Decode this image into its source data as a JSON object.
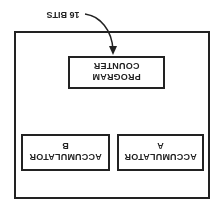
{
  "diagram": {
    "orientation": "rotated 180 degrees",
    "outer_box": {
      "label": ""
    },
    "program_counter": {
      "line1": "PROGRAM",
      "line2": "COUNTER"
    },
    "annotation": {
      "text": "16 BITS"
    },
    "accumulator_a": {
      "line1": "ACCUMULATOR",
      "line2": "A"
    },
    "accumulator_b": {
      "line1": "ACCUMULATOR",
      "line2": "B"
    },
    "colors": {
      "line": "#222222",
      "background": "#ffffff"
    }
  }
}
